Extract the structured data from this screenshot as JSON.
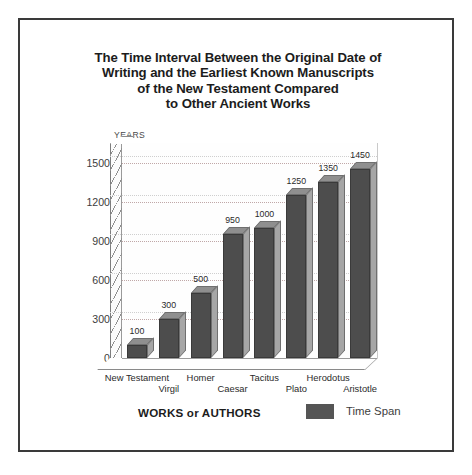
{
  "chart_data": {
    "type": "bar",
    "title": "The Time Interval Between the Original Date of Writing and the Earliest Known Manuscripts of the New Testament Compared to Other Ancient Works",
    "title_lines": [
      "The Time Interval Between the Original Date of",
      "Writing and the Earliest Known Manuscripts",
      "of the New Testament Compared",
      "to Other Ancient Works"
    ],
    "categories": [
      "New Testament",
      "Virgil",
      "Homer",
      "Caesar",
      "Tacitus",
      "Plato",
      "Herodotus",
      "Aristotle"
    ],
    "values": [
      100,
      300,
      500,
      950,
      1000,
      1250,
      1350,
      1450
    ],
    "series": [
      {
        "name": "Time Span",
        "values": [
          100,
          300,
          500,
          950,
          1000,
          1250,
          1350,
          1450
        ]
      }
    ],
    "xlabel": "WORKS or AUTHORS",
    "ylabel": "YEARS",
    "ylim": [
      0,
      1650
    ],
    "yticks": [
      0,
      300,
      600,
      900,
      1200,
      1500
    ],
    "ytick_labels": [
      "0",
      "300",
      "600",
      "900",
      "1200",
      "1500"
    ],
    "grid": true,
    "legend_position": "bottom-right",
    "legend_entries": [
      "Time Span"
    ],
    "bar_color": "#4d4d4d",
    "bar_side_color": "#a6a6a6",
    "bar_top_color": "#8f8f8f"
  },
  "legend": {
    "axis_title": "WORKS or AUTHORS",
    "swatch_label": "Time Span",
    "swatch_color": "#555555"
  }
}
